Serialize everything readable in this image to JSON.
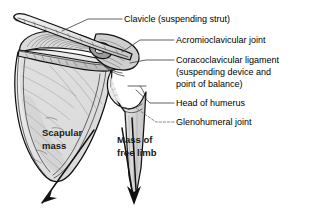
{
  "figure": {
    "background_color": "#ffffff",
    "line_color": "#111111",
    "bone_fill_color": "#e8e8e8",
    "leader_color": "#3a3a3a"
  },
  "callouts": [
    {
      "id": "clavicle",
      "lines": [
        "Clavicle (suspending strut)"
      ],
      "x": 124,
      "y": 22
    },
    {
      "id": "acromioclavicular-joint",
      "lines": [
        "Acromioclavicular joint"
      ],
      "x": 176,
      "y": 43
    },
    {
      "id": "coracoclavicular-ligament",
      "lines": [
        "Coracoclavicular ligament",
        "(suspending device and",
        "point of balance)"
      ],
      "x": 176,
      "y": 63
    },
    {
      "id": "head-of-humerus",
      "lines": [
        "Head of humerus"
      ],
      "x": 176,
      "y": 106
    },
    {
      "id": "glenohumeral-joint",
      "lines": [
        "Glenohumeral joint"
      ],
      "x": 176,
      "y": 125
    }
  ],
  "overlay_labels": [
    {
      "id": "scapular-mass",
      "lines": [
        "Scapular",
        "mass"
      ],
      "x": 42,
      "y": 136
    },
    {
      "id": "mass-of-free-limb",
      "lines": [
        "Mass of",
        "free limb"
      ],
      "x": 117,
      "y": 143
    }
  ],
  "force_arrows": [
    {
      "id": "scapular-mass-arrow",
      "direction": "down-left"
    },
    {
      "id": "free-limb-arrow",
      "direction": "down"
    }
  ]
}
